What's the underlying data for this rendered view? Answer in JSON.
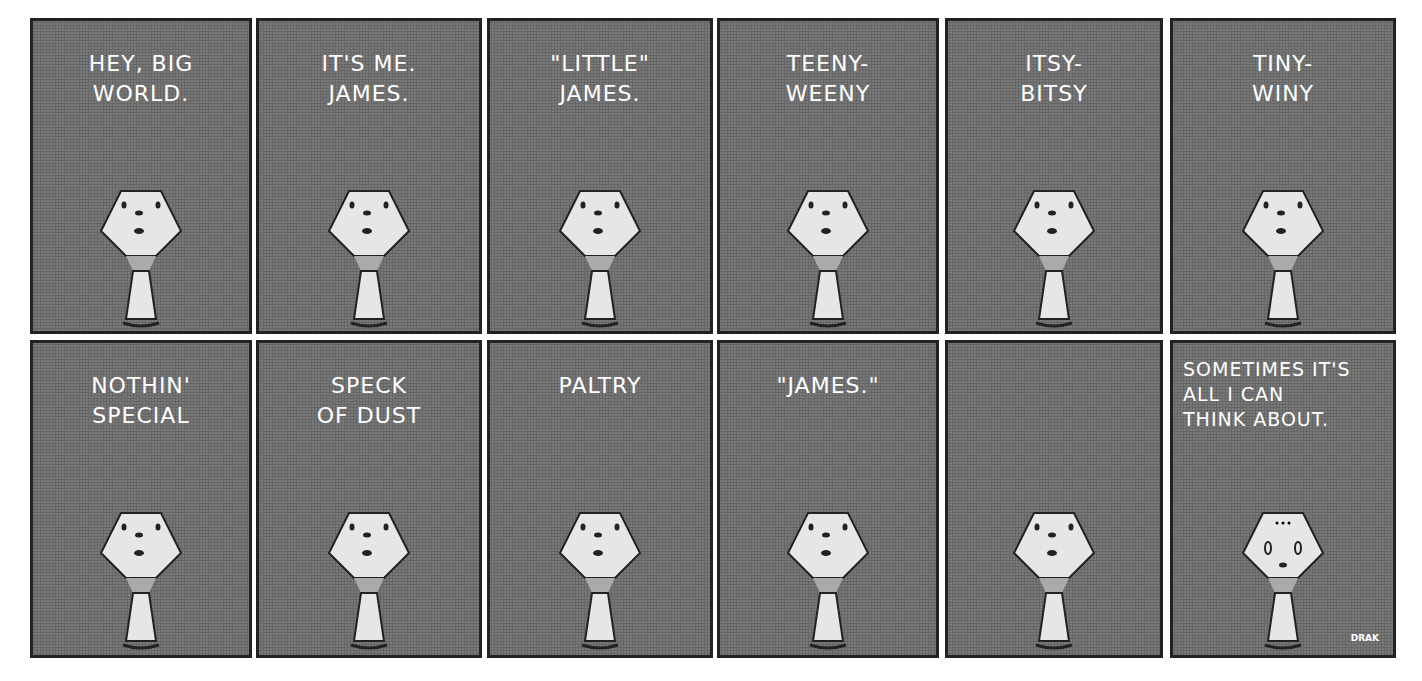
{
  "comic": {
    "panels": [
      {
        "caption": "HEY, BIG\nWORLD.",
        "face": "normal"
      },
      {
        "caption": "IT'S ME.\nJAMES.",
        "face": "normal"
      },
      {
        "caption": "\"LITTLE\"\nJAMES.",
        "face": "normal"
      },
      {
        "caption": "TEENY-\nWEENY",
        "face": "normal"
      },
      {
        "caption": "ITSY-\nBITSY",
        "face": "normal"
      },
      {
        "caption": "TINY-\nWINY",
        "face": "normal"
      },
      {
        "caption": "NOTHIN'\nSPECIAL",
        "face": "normal"
      },
      {
        "caption": "SPECK\nOF DUST",
        "face": "normal"
      },
      {
        "caption": "PALTRY",
        "face": "normal"
      },
      {
        "caption": "\"JAMES.\"",
        "face": "normal"
      },
      {
        "caption": "",
        "face": "normal"
      },
      {
        "caption": "SOMETIMES IT'S\nALL I CAN\nTHINK ABOUT.",
        "face": "sad"
      }
    ],
    "signature": "DRAK",
    "colors": {
      "panel_bg": "#7a7a7a",
      "border": "#222222",
      "figure": "#e6e6e6"
    }
  }
}
